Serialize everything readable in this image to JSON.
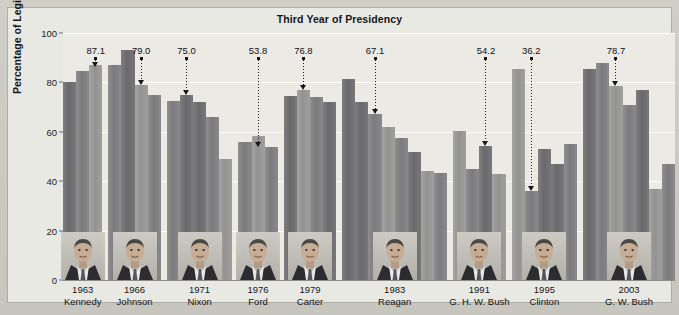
{
  "chart_data": {
    "type": "bar",
    "title": "Third Year of Presidency",
    "xlabel": "",
    "ylabel": "Percentage of Legislation Passed",
    "ylim": [
      0,
      100
    ],
    "yticks": [
      0,
      20,
      40,
      60,
      80,
      100
    ],
    "grid": true,
    "legend": "none",
    "note": "Each group is one president's full term, one bar per year. The labelled bar is the third year of that presidency.",
    "groups": [
      {
        "president": "Kennedy",
        "year_label": "1963",
        "highlight_value": 87.1,
        "highlight_index": 2,
        "values": [
          80.0,
          84.5,
          87.1
        ]
      },
      {
        "president": "Johnson",
        "year_label": "1966",
        "highlight_value": 79.0,
        "highlight_index": 2,
        "values": [
          87.0,
          93.0,
          79.0,
          75.0
        ]
      },
      {
        "president": "Nixon",
        "year_label": "1971",
        "highlight_value": 75.0,
        "highlight_index": 1,
        "values": [
          72.5,
          75.0,
          72.0,
          66.0,
          49.0
        ]
      },
      {
        "president": "Ford",
        "year_label": "1976",
        "highlight_value": 53.8,
        "highlight_index": 1,
        "values": [
          56.0,
          58.5,
          53.8
        ]
      },
      {
        "president": "Carter",
        "year_label": "1979",
        "highlight_value": 76.8,
        "highlight_index": 1,
        "values": [
          74.5,
          76.8,
          74.0,
          72.0
        ]
      },
      {
        "president": "Reagan",
        "year_label": "1983",
        "highlight_value": 67.1,
        "highlight_index": 2,
        "values": [
          81.5,
          72.0,
          67.1,
          62.0,
          57.5,
          52.0,
          44.0,
          43.5
        ]
      },
      {
        "president": "G. H. W. Bush",
        "year_label": "1991",
        "highlight_value": 54.2,
        "highlight_index": 2,
        "values": [
          60.5,
          45.0,
          54.2,
          43.0
        ]
      },
      {
        "president": "Clinton",
        "year_label": "1995",
        "highlight_value": 36.2,
        "highlight_index": 1,
        "values": [
          85.5,
          36.2,
          53.0,
          47.0,
          55.0
        ]
      },
      {
        "president": "G. W. Bush",
        "year_label": "2003",
        "highlight_value": 78.7,
        "highlight_index": 2,
        "values": [
          85.5,
          88.0,
          78.7,
          71.0,
          77.0,
          37.0,
          47.0
        ]
      }
    ]
  }
}
